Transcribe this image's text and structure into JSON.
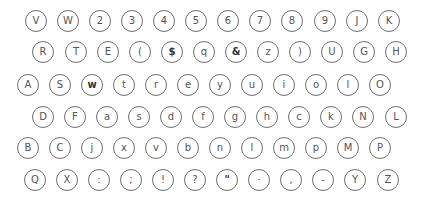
{
  "keyboard": {
    "rows": [
      {
        "y": 21,
        "keys": [
          {
            "c": "V",
            "x": 36
          },
          {
            "c": "W",
            "x": 68
          },
          {
            "c": "2",
            "x": 100
          },
          {
            "c": "3",
            "x": 132
          },
          {
            "c": "4",
            "x": 164
          },
          {
            "c": "5",
            "x": 196
          },
          {
            "c": "6",
            "x": 228
          },
          {
            "c": "7",
            "x": 260
          },
          {
            "c": "8",
            "x": 292
          },
          {
            "c": "9",
            "x": 325
          },
          {
            "c": "J",
            "x": 357
          },
          {
            "c": "K",
            "x": 389
          }
        ]
      },
      {
        "y": 52,
        "keys": [
          {
            "c": "R",
            "x": 43
          },
          {
            "c": "T",
            "x": 76
          },
          {
            "c": "E",
            "x": 108
          },
          {
            "c": "(",
            "x": 140
          },
          {
            "c": "$",
            "x": 172,
            "b": true
          },
          {
            "c": "q",
            "x": 204
          },
          {
            "c": "&",
            "x": 236,
            "b": true
          },
          {
            "c": "z",
            "x": 268
          },
          {
            "c": ")",
            "x": 300
          },
          {
            "c": "U",
            "x": 332
          },
          {
            "c": "G",
            "x": 364
          },
          {
            "c": "H",
            "x": 396
          }
        ]
      },
      {
        "y": 85,
        "keys": [
          {
            "c": "A",
            "x": 28
          },
          {
            "c": "S",
            "x": 60
          },
          {
            "c": "w",
            "x": 92,
            "b": true
          },
          {
            "c": "t",
            "x": 124
          },
          {
            "c": "r",
            "x": 156
          },
          {
            "c": "e",
            "x": 188
          },
          {
            "c": "y",
            "x": 220
          },
          {
            "c": "u",
            "x": 252
          },
          {
            "c": "i",
            "x": 284
          },
          {
            "c": "o",
            "x": 316
          },
          {
            "c": "l",
            "x": 348
          },
          {
            "c": "O",
            "x": 380
          }
        ]
      },
      {
        "y": 117,
        "keys": [
          {
            "c": "D",
            "x": 43
          },
          {
            "c": "F",
            "x": 75
          },
          {
            "c": "a",
            "x": 107
          },
          {
            "c": "s",
            "x": 139
          },
          {
            "c": "d",
            "x": 171
          },
          {
            "c": "f",
            "x": 203
          },
          {
            "c": "g",
            "x": 235
          },
          {
            "c": "h",
            "x": 267
          },
          {
            "c": "c",
            "x": 299
          },
          {
            "c": "k",
            "x": 331
          },
          {
            "c": "N",
            "x": 363
          },
          {
            "c": "L",
            "x": 396
          }
        ]
      },
      {
        "y": 148,
        "keys": [
          {
            "c": "B",
            "x": 28
          },
          {
            "c": "C",
            "x": 60
          },
          {
            "c": "j",
            "x": 92
          },
          {
            "c": "x",
            "x": 124
          },
          {
            "c": "v",
            "x": 156
          },
          {
            "c": "b",
            "x": 188
          },
          {
            "c": "n",
            "x": 220
          },
          {
            "c": "l",
            "x": 252
          },
          {
            "c": "m",
            "x": 284
          },
          {
            "c": "p",
            "x": 316
          },
          {
            "c": "M",
            "x": 348
          },
          {
            "c": "P",
            "x": 380
          }
        ]
      },
      {
        "y": 180,
        "keys": [
          {
            "c": "Q",
            "x": 35
          },
          {
            "c": "X",
            "x": 67
          },
          {
            "c": ":",
            "x": 99
          },
          {
            "c": ";",
            "x": 131
          },
          {
            "c": "!",
            "x": 163
          },
          {
            "c": "?",
            "x": 195
          },
          {
            "c": "\"",
            "x": 227,
            "b": true
          },
          {
            "c": "·",
            "x": 259
          },
          {
            "c": ",",
            "x": 291
          },
          {
            "c": "-",
            "x": 323
          },
          {
            "c": "Y",
            "x": 355
          },
          {
            "c": "Z",
            "x": 388
          }
        ]
      }
    ]
  }
}
